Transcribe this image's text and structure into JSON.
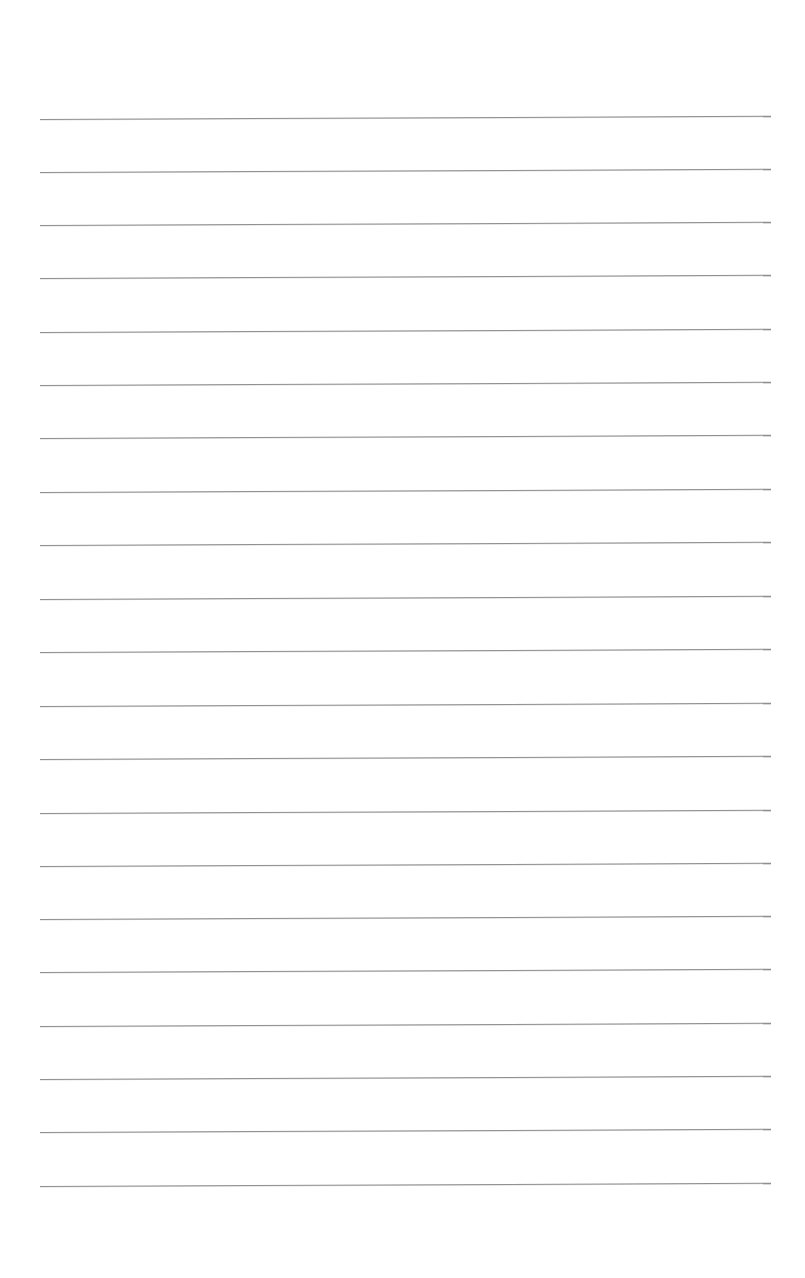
{
  "page": {
    "type": "blank-ruled-sheet",
    "background_color": "#ffffff",
    "rule_color": "#8f8f8f",
    "rule_count": 21,
    "rules": [
      {
        "y": 119
      },
      {
        "y": 172
      },
      {
        "y": 225
      },
      {
        "y": 278
      },
      {
        "y": 332
      },
      {
        "y": 385
      },
      {
        "y": 438
      },
      {
        "y": 492
      },
      {
        "y": 545
      },
      {
        "y": 599
      },
      {
        "y": 652
      },
      {
        "y": 706
      },
      {
        "y": 759
      },
      {
        "y": 813
      },
      {
        "y": 866
      },
      {
        "y": 919
      },
      {
        "y": 972
      },
      {
        "y": 1026
      },
      {
        "y": 1079
      },
      {
        "y": 1132
      },
      {
        "y": 1186
      }
    ]
  }
}
